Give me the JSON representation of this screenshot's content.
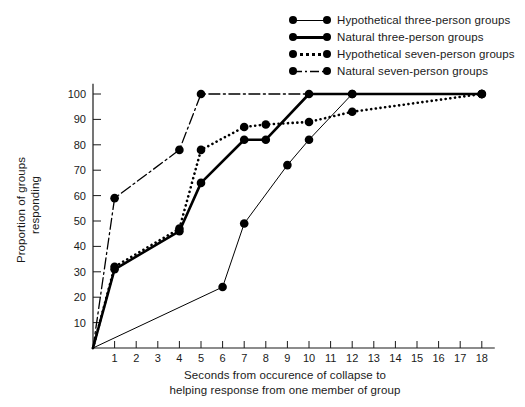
{
  "chart_data": {
    "type": "line",
    "title": "",
    "xlabel_line1": "Seconds from occurence of collapse to",
    "xlabel_line2": "helping response from one member of group",
    "ylabel_line1": "Proportion of groups",
    "ylabel_line2": "responding",
    "xlim": [
      0,
      18.6
    ],
    "ylim": [
      0,
      104
    ],
    "xticks": [
      1,
      2,
      3,
      4,
      5,
      6,
      7,
      8,
      9,
      10,
      11,
      12,
      13,
      14,
      15,
      16,
      17,
      18
    ],
    "yticks": [
      10,
      20,
      30,
      40,
      50,
      60,
      70,
      80,
      90,
      100
    ],
    "grid": false,
    "legend_position": "top-right",
    "marker": "filled-circle",
    "series": [
      {
        "name": "Hypothetical three-person groups",
        "style": "thin-solid",
        "color": "#000000",
        "points": [
          {
            "x": 0,
            "y": 0
          },
          {
            "x": 6,
            "y": 24
          },
          {
            "x": 7,
            "y": 49
          },
          {
            "x": 9,
            "y": 72
          },
          {
            "x": 10,
            "y": 82
          },
          {
            "x": 12,
            "y": 100
          },
          {
            "x": 18,
            "y": 100
          }
        ]
      },
      {
        "name": "Natural three-person groups",
        "style": "thick-solid",
        "color": "#000000",
        "points": [
          {
            "x": 0,
            "y": 0
          },
          {
            "x": 1,
            "y": 31
          },
          {
            "x": 4,
            "y": 46
          },
          {
            "x": 5,
            "y": 65
          },
          {
            "x": 7,
            "y": 82
          },
          {
            "x": 8,
            "y": 82
          },
          {
            "x": 10,
            "y": 100
          },
          {
            "x": 12,
            "y": 100
          },
          {
            "x": 18,
            "y": 100
          }
        ]
      },
      {
        "name": "Hypothetical seven-person groups",
        "style": "dotted",
        "color": "#000000",
        "points": [
          {
            "x": 0,
            "y": 0
          },
          {
            "x": 1,
            "y": 32
          },
          {
            "x": 4,
            "y": 47
          },
          {
            "x": 5,
            "y": 78
          },
          {
            "x": 7,
            "y": 87
          },
          {
            "x": 8,
            "y": 88
          },
          {
            "x": 10,
            "y": 89
          },
          {
            "x": 12,
            "y": 93
          },
          {
            "x": 18,
            "y": 100
          }
        ]
      },
      {
        "name": "Natural seven-person groups",
        "style": "dash-dot",
        "color": "#000000",
        "points": [
          {
            "x": 0,
            "y": 0
          },
          {
            "x": 1,
            "y": 59
          },
          {
            "x": 4,
            "y": 78
          },
          {
            "x": 5,
            "y": 100
          },
          {
            "x": 18,
            "y": 100
          }
        ]
      }
    ]
  },
  "legend": {
    "items": [
      {
        "label": "Hypothetical three-person groups"
      },
      {
        "label": "Natural three-person groups"
      },
      {
        "label": "Hypothetical seven-person groups"
      },
      {
        "label": "Natural seven-person groups"
      }
    ]
  }
}
